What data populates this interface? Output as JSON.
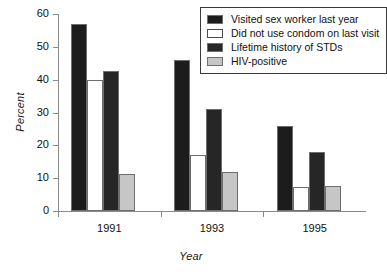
{
  "chart_data": {
    "type": "bar",
    "title": "",
    "xlabel": "Year",
    "ylabel": "Percent",
    "categories": [
      "1991",
      "1993",
      "1995"
    ],
    "ylim": [
      0,
      60
    ],
    "yticks": [
      0,
      10,
      20,
      30,
      40,
      50,
      60
    ],
    "grid": false,
    "legend_position": "top-right",
    "series": [
      {
        "name": "Visited sex worker last year",
        "color": "#1c1c1c",
        "values": [
          57,
          46,
          26
        ]
      },
      {
        "name": "Did not use condom on last visit",
        "color": "#ffffff",
        "values": [
          40,
          17,
          7.3
        ]
      },
      {
        "name": "Lifetime history of STDs",
        "color": "#262626",
        "values": [
          42.5,
          31,
          18
        ]
      },
      {
        "name": "HIV-positive",
        "color": "#c6c6c6",
        "values": [
          11.2,
          12,
          7.6
        ]
      }
    ]
  }
}
